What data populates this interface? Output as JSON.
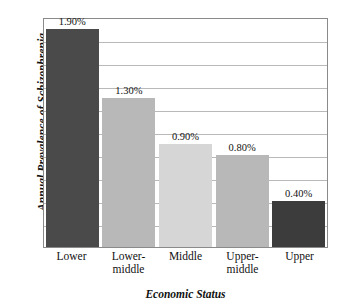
{
  "chart_data": {
    "type": "bar",
    "title": "",
    "xlabel": "Economic Status",
    "ylabel": "Annual Prevalence of Schizophrenia",
    "categories": [
      "Lower",
      "Lower-middle",
      "Middle",
      "Upper-middle",
      "Upper"
    ],
    "category_lines": [
      [
        "Lower"
      ],
      [
        "Lower-",
        "middle"
      ],
      [
        "Middle"
      ],
      [
        "Upper-",
        "middle"
      ],
      [
        "Upper"
      ]
    ],
    "values": [
      1.9,
      1.3,
      0.9,
      0.8,
      0.4
    ],
    "value_labels": [
      "1.90%",
      "1.30%",
      "0.90%",
      "0.80%",
      "0.40%"
    ],
    "bar_colors": [
      "#4a4a4a",
      "#b8b8b8",
      "#d6d6d6",
      "#b8b8b8",
      "#3c3c3c"
    ],
    "ylim": [
      0,
      2.0
    ],
    "ytick_step": 0.2,
    "gridline_count": 9,
    "grid": true,
    "ytick_labels_visible": false,
    "legend": "none",
    "frame_color": "#8a8a8a",
    "grid_color": "#b9b9b9",
    "text_color": "#111111",
    "background": "#ffffff"
  }
}
